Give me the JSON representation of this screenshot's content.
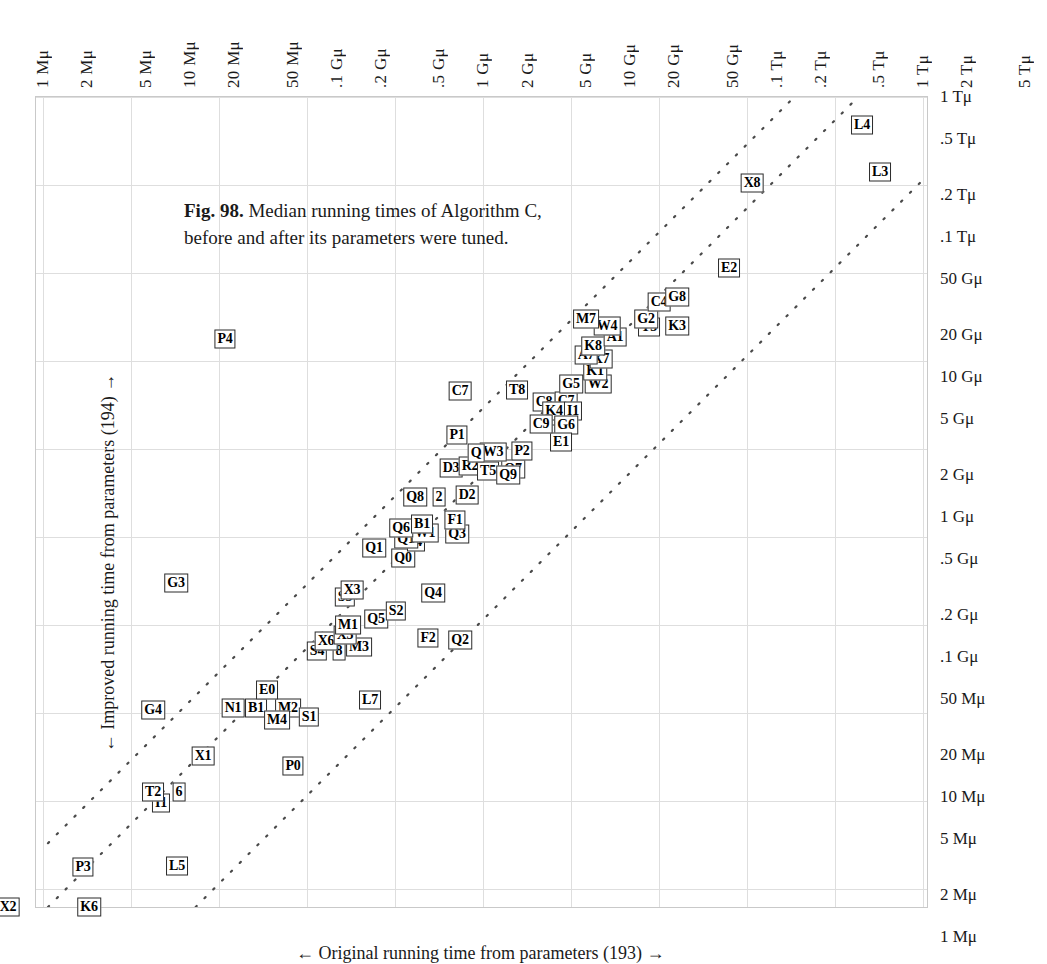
{
  "figure": {
    "caption_bold": "Fig. 98.",
    "caption_text": " Median running times of Algorithm C, before and after its parameters were tuned.",
    "x_axis_title": "← Original running time from parameters (193) →",
    "y_axis_title": "← Improved running time from parameters (194) →"
  },
  "chart_data": {
    "type": "scatter",
    "title": "Fig. 98. Median running times of Algorithm C, before and after its parameters were tuned.",
    "xlabel": "← Original running time from parameters (193) →",
    "ylabel": "← Improved running time from parameters (194) →",
    "scale": "log-log",
    "grid": true,
    "legend": "none",
    "xlim": [
      "1 Mμ",
      "5 Tμ"
    ],
    "ylim": [
      "1 Mμ",
      "1 Tμ"
    ],
    "x_tick_labels": [
      "1 Mμ",
      "2 Mμ",
      "5 Mμ",
      "10 Mμ",
      "20 Mμ",
      "50 Mμ",
      ".1 Gμ",
      ".2 Gμ",
      ".5 Gμ",
      "1 Gμ",
      "2 Gμ",
      "5 Gμ",
      "10 Gμ",
      "20 Gμ",
      "50 Gμ",
      ".1 Tμ",
      ".2 Tμ",
      ".5 Tμ",
      "1 Tμ",
      "2 Tμ",
      "5 Tμ"
    ],
    "x_tick_values": [
      1000000.0,
      2000000.0,
      5000000.0,
      10000000.0,
      20000000.0,
      50000000.0,
      100000000.0,
      200000000.0,
      500000000.0,
      1000000000.0,
      2000000000.0,
      5000000000.0,
      10000000000.0,
      20000000000.0,
      50000000000.0,
      100000000000.0,
      200000000000.0,
      500000000000.0,
      1000000000000.0,
      2000000000000.0,
      5000000000000.0
    ],
    "y_tick_labels": [
      "1 Tμ",
      ".5 Tμ",
      ".2 Tμ",
      ".1 Tμ",
      "50 Gμ",
      "20 Gμ",
      "10 Gμ",
      "5 Gμ",
      "2 Gμ",
      "1 Gμ",
      ".5 Gμ",
      ".2 Gμ",
      ".1 Gμ",
      "50 Mμ",
      "20 Mμ",
      "10 Mμ",
      "5 Mμ",
      "2 Mμ",
      "1 Mμ"
    ],
    "y_tick_values": [
      1000000000000.0,
      500000000000.0,
      200000000000.0,
      100000000000.0,
      50000000000.0,
      20000000000.0,
      10000000000.0,
      5000000000.0,
      2000000000.0,
      1000000000.0,
      500000000.0,
      200000000.0,
      100000000.0,
      50000000.0,
      20000000.0,
      10000000.0,
      5000000.0,
      2000000.0,
      1000000.0
    ],
    "reference_lines": [
      {
        "kind": "diagonal",
        "style": "dotted",
        "note": "upper identity-offset line"
      },
      {
        "kind": "diagonal",
        "style": "dotted",
        "note": "lower identity-offset line"
      }
    ],
    "points": [
      {
        "label": "X2",
        "x": 7,
        "y": 906
      },
      {
        "label": "K6",
        "x": 88,
        "y": 906
      },
      {
        "label": "P3",
        "x": 82,
        "y": 866
      },
      {
        "label": "L5",
        "x": 176,
        "y": 865
      },
      {
        "label": "I1",
        "x": 160,
        "y": 802
      },
      {
        "label": "T2",
        "x": 152,
        "y": 791
      },
      {
        "label": "6",
        "x": 178,
        "y": 791
      },
      {
        "label": "X1",
        "x": 202,
        "y": 755
      },
      {
        "label": "P0",
        "x": 292,
        "y": 765
      },
      {
        "label": "G4",
        "x": 152,
        "y": 709
      },
      {
        "label": "N1",
        "x": 232,
        "y": 707
      },
      {
        "label": "B1",
        "x": 255,
        "y": 707
      },
      {
        "label": "M2",
        "x": 287,
        "y": 707
      },
      {
        "label": "E0",
        "x": 266,
        "y": 689
      },
      {
        "label": "M4",
        "x": 276,
        "y": 719
      },
      {
        "label": "S1",
        "x": 308,
        "y": 716
      },
      {
        "label": "L7",
        "x": 369,
        "y": 699
      },
      {
        "label": "S4",
        "x": 316,
        "y": 650
      },
      {
        "label": "8",
        "x": 338,
        "y": 650
      },
      {
        "label": "M3",
        "x": 358,
        "y": 646
      },
      {
        "label": "X6",
        "x": 325,
        "y": 640
      },
      {
        "label": "X5",
        "x": 344,
        "y": 634
      },
      {
        "label": "M1",
        "x": 347,
        "y": 624
      },
      {
        "label": "Q5",
        "x": 375,
        "y": 618
      },
      {
        "label": "S2",
        "x": 395,
        "y": 610
      },
      {
        "label": "S3",
        "x": 344,
        "y": 596
      },
      {
        "label": "X3",
        "x": 351,
        "y": 589
      },
      {
        "label": "Q4",
        "x": 432,
        "y": 592
      },
      {
        "label": "F2",
        "x": 427,
        "y": 637
      },
      {
        "label": "Q2",
        "x": 459,
        "y": 639
      },
      {
        "label": "G3",
        "x": 175,
        "y": 582
      },
      {
        "label": "Q1",
        "x": 373,
        "y": 547
      },
      {
        "label": "Q0",
        "x": 402,
        "y": 557
      },
      {
        "label": "I4",
        "x": 415,
        "y": 541
      },
      {
        "label": "Q1b",
        "x": 405,
        "y": 538
      },
      {
        "label": "W1",
        "x": 424,
        "y": 532
      },
      {
        "label": "Q6",
        "x": 400,
        "y": 527
      },
      {
        "label": "B1b",
        "x": 421,
        "y": 523
      },
      {
        "label": "Q3",
        "x": 456,
        "y": 533
      },
      {
        "label": "F1",
        "x": 454,
        "y": 519
      },
      {
        "label": "Q8",
        "x": 414,
        "y": 496
      },
      {
        "label": "2",
        "x": 438,
        "y": 496
      },
      {
        "label": "D2",
        "x": 466,
        "y": 494
      },
      {
        "label": "D3",
        "x": 450,
        "y": 467
      },
      {
        "label": "R2",
        "x": 469,
        "y": 465
      },
      {
        "label": "T5",
        "x": 487,
        "y": 470
      },
      {
        "label": "Q7",
        "x": 512,
        "y": 468
      },
      {
        "label": "Q9",
        "x": 507,
        "y": 474
      },
      {
        "label": "W3",
        "x": 492,
        "y": 451
      },
      {
        "label": "P2",
        "x": 521,
        "y": 450
      },
      {
        "label": "Q",
        "x": 475,
        "y": 452
      },
      {
        "label": "P1",
        "x": 456,
        "y": 434
      },
      {
        "label": "C2",
        "x": 556,
        "y": 415
      },
      {
        "label": "C8",
        "x": 543,
        "y": 401
      },
      {
        "label": "C7",
        "x": 565,
        "y": 400
      },
      {
        "label": "K4",
        "x": 553,
        "y": 410
      },
      {
        "label": "I1b",
        "x": 572,
        "y": 410
      },
      {
        "label": "G6",
        "x": 565,
        "y": 424
      },
      {
        "label": "E1",
        "x": 560,
        "y": 441
      },
      {
        "label": "C9",
        "x": 540,
        "y": 423
      },
      {
        "label": "C7b",
        "x": 459,
        "y": 390
      },
      {
        "label": "T8",
        "x": 516,
        "y": 389
      },
      {
        "label": "G5",
        "x": 570,
        "y": 383
      },
      {
        "label": "W2",
        "x": 597,
        "y": 383
      },
      {
        "label": "K1",
        "x": 594,
        "y": 370
      },
      {
        "label": "X7",
        "x": 600,
        "y": 358
      },
      {
        "label": "A7",
        "x": 585,
        "y": 354
      },
      {
        "label": "K8",
        "x": 592,
        "y": 345
      },
      {
        "label": "A1",
        "x": 614,
        "y": 336
      },
      {
        "label": "W4",
        "x": 606,
        "y": 325
      },
      {
        "label": "M7",
        "x": 585,
        "y": 318
      },
      {
        "label": "T3",
        "x": 648,
        "y": 326
      },
      {
        "label": "G2",
        "x": 645,
        "y": 318
      },
      {
        "label": "K3",
        "x": 676,
        "y": 325
      },
      {
        "label": "C4",
        "x": 658,
        "y": 301
      },
      {
        "label": "G8",
        "x": 676,
        "y": 296
      },
      {
        "label": "E2",
        "x": 728,
        "y": 267
      },
      {
        "label": "X8",
        "x": 751,
        "y": 182
      },
      {
        "label": "L3",
        "x": 879,
        "y": 171
      },
      {
        "label": "L4",
        "x": 861,
        "y": 124
      },
      {
        "label": "P4",
        "x": 224,
        "y": 338
      }
    ]
  },
  "axes": {
    "top_ticks": [
      {
        "label": "1 Mμ",
        "x": 42
      },
      {
        "label": "2 Mμ",
        "x": 86
      },
      {
        "label": "5 Mμ",
        "x": 145
      },
      {
        "label": "10 Mμ",
        "x": 189
      },
      {
        "label": "20 Mμ",
        "x": 233
      },
      {
        "label": "50 Mμ",
        "x": 292
      },
      {
        "label": ".1 Gμ",
        "x": 336
      },
      {
        "label": ".2 Gμ",
        "x": 380
      },
      {
        "label": ".5 Gμ",
        "x": 438
      },
      {
        "label": "1 Gμ",
        "x": 482
      },
      {
        "label": "2 Gμ",
        "x": 527
      },
      {
        "label": "5 Gμ",
        "x": 585
      },
      {
        "label": "10 Gμ",
        "x": 629
      },
      {
        "label": "20 Gμ",
        "x": 673
      },
      {
        "label": "50 Gμ",
        "x": 732
      },
      {
        "label": ".1 Tμ",
        "x": 776
      },
      {
        "label": ".2 Tμ",
        "x": 820
      },
      {
        "label": ".5 Tμ",
        "x": 878
      },
      {
        "label": "1 Tμ",
        "x": 922
      },
      {
        "label": "2 Tμ",
        "x": 966
      },
      {
        "label": "5 Tμ",
        "x": 1024
      }
    ],
    "right_ticks": [
      {
        "label": "1 Tμ",
        "y": 97
      },
      {
        "label": ".5 Tμ",
        "y": 139
      },
      {
        "label": ".2 Tμ",
        "y": 195
      },
      {
        "label": ".1 Tμ",
        "y": 237
      },
      {
        "label": "50 Gμ",
        "y": 279
      },
      {
        "label": "20 Gμ",
        "y": 335
      },
      {
        "label": "10 Gμ",
        "y": 377
      },
      {
        "label": "5 Gμ",
        "y": 419
      },
      {
        "label": "2 Gμ",
        "y": 475
      },
      {
        "label": "1 Gμ",
        "y": 517
      },
      {
        "label": ".5 Gμ",
        "y": 559
      },
      {
        "label": ".2 Gμ",
        "y": 615
      },
      {
        "label": ".1 Gμ",
        "y": 657
      },
      {
        "label": "50 Mμ",
        "y": 699
      },
      {
        "label": "20 Mμ",
        "y": 755
      },
      {
        "label": "10 Mμ",
        "y": 797
      },
      {
        "label": "5 Mμ",
        "y": 839
      },
      {
        "label": "2 Mμ",
        "y": 895
      },
      {
        "label": "1 Mμ",
        "y": 937
      }
    ],
    "grid_v_x": [
      7,
      95,
      183,
      271,
      359,
      447,
      535,
      623,
      711,
      799,
      887
    ],
    "grid_h_y": [
      0,
      88,
      176,
      264,
      352,
      440,
      528,
      616,
      704,
      792
    ]
  }
}
